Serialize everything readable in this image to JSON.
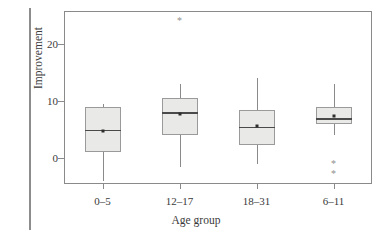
{
  "figure": {
    "kind": "boxplot-figure",
    "background": "#ffffff",
    "frame_color": "#8a8a8a",
    "box_fill": "#e9e9e7",
    "box_edge": "#9a9a9a",
    "median_color": "#4a4a4a",
    "whisker_color": "#8a8a8a",
    "mean_color": "#2e2e2e",
    "outlier_color": "#8f8f8f",
    "outlier_glyph": "*"
  },
  "chart_data": {
    "type": "box",
    "title": "",
    "xlabel": "Age group",
    "ylabel": "Improvement",
    "categories": [
      "0–5",
      "12–17",
      "18–31",
      "6–11"
    ],
    "yticks": [
      0,
      10,
      20
    ],
    "ytick_labels": [
      "0",
      "10",
      "20"
    ],
    "ylim": [
      -5.5,
      24.9
    ],
    "grid": false,
    "legend": null,
    "boxes": [
      {
        "category": "0–5",
        "whisker_low": -4.0,
        "q1": 1.1,
        "median": 5.0,
        "q3": 9.0,
        "whisker_high": 9.5,
        "mean": 4.8,
        "outliers": []
      },
      {
        "category": "12–17",
        "whisker_low": -1.6,
        "q1": 4.0,
        "median": 8.0,
        "q3": 10.5,
        "whisker_high": 13.0,
        "mean": 7.8,
        "outliers": [
          24.0
        ]
      },
      {
        "category": "18–31",
        "whisker_low": -1.1,
        "q1": 2.2,
        "median": 5.5,
        "q3": 8.5,
        "whisker_high": 14.0,
        "mean": 5.7,
        "outliers": []
      },
      {
        "category": "6–11",
        "whisker_low": 4.0,
        "q1": 6.0,
        "median": 7.0,
        "q3": 9.0,
        "whisker_high": 13.0,
        "mean": 7.4,
        "outliers": [
          -1.0,
          -2.8
        ]
      }
    ]
  }
}
